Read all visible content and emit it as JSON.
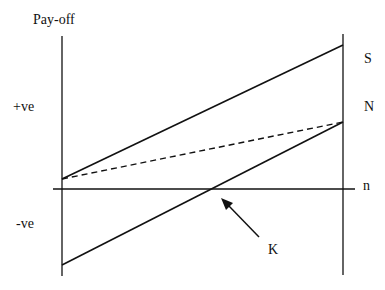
{
  "diagram": {
    "y_axis_label": "Pay-off",
    "positive_label": "+ve",
    "negative_label": "-ve",
    "x_axis_end_label": "n",
    "line_labels": {
      "S": "S",
      "N": "N"
    },
    "annotation": "K",
    "colors": {
      "line": "#111111",
      "background": "#ffffff"
    }
  }
}
